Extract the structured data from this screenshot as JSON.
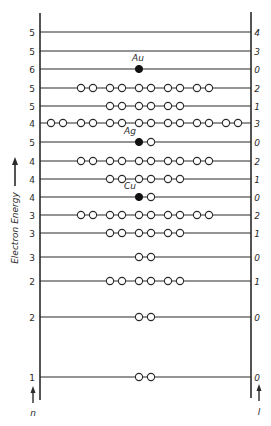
{
  "diagram": {
    "type": "electron energy level diagram",
    "y_axis_label": "Electron Energy",
    "left_axis_label": "n",
    "right_axis_label": "l",
    "axis": {
      "left_x": 40,
      "right_x": 251,
      "top_y": 13,
      "bottom_y": 400
    },
    "pair_positions": [
      51,
      81,
      110,
      139,
      168,
      197,
      226
    ],
    "pair_gap": 12,
    "levels": [
      {
        "n": "5",
        "l": "4",
        "y": 32,
        "pairs": [],
        "element": null
      },
      {
        "n": "5",
        "l": "3",
        "y": 51,
        "pairs": [],
        "element": null
      },
      {
        "n": "6",
        "l": "0",
        "y": 69,
        "pairs": [],
        "element": {
          "symbol": "Au",
          "filled": 1,
          "empty": 0
        }
      },
      {
        "n": "5",
        "l": "2",
        "y": 88,
        "pairs": [
          81,
          110,
          139,
          168,
          197
        ],
        "element": null
      },
      {
        "n": "5",
        "l": "1",
        "y": 106,
        "pairs": [
          110,
          139,
          168
        ],
        "element": null
      },
      {
        "n": "4",
        "l": "3",
        "y": 123,
        "pairs": [
          51,
          81,
          110,
          139,
          168,
          197,
          226
        ],
        "element": null
      },
      {
        "n": "5",
        "l": "0",
        "y": 142,
        "pairs": [],
        "element": {
          "symbol": "Ag",
          "filled": 1,
          "empty": 1
        }
      },
      {
        "n": "4",
        "l": "2",
        "y": 161,
        "pairs": [
          81,
          110,
          139,
          168,
          197
        ],
        "element": null
      },
      {
        "n": "4",
        "l": "1",
        "y": 179,
        "pairs": [
          110,
          139,
          168
        ],
        "element": null
      },
      {
        "n": "4",
        "l": "0",
        "y": 197,
        "pairs": [],
        "element": {
          "symbol": "Cu",
          "filled": 1,
          "empty": 1
        }
      },
      {
        "n": "3",
        "l": "2",
        "y": 215,
        "pairs": [
          81,
          110,
          139,
          168,
          197
        ],
        "element": null
      },
      {
        "n": "3",
        "l": "1",
        "y": 233,
        "pairs": [
          110,
          139,
          168
        ],
        "element": null
      },
      {
        "n": "3",
        "l": "0",
        "y": 257,
        "pairs": [
          139
        ],
        "element": null
      },
      {
        "n": "2",
        "l": "1",
        "y": 281,
        "pairs": [
          110,
          139,
          168
        ],
        "element": null
      },
      {
        "n": "2",
        "l": "0",
        "y": 317,
        "pairs": [
          139
        ],
        "element": null
      },
      {
        "n": "1",
        "l": "0",
        "y": 377,
        "pairs": [
          139
        ],
        "element": null
      }
    ],
    "colors": {
      "line": "#2a2a2a",
      "filled_electron": "#111111",
      "empty_electron": "#ffffff",
      "background": "#ffffff"
    }
  }
}
